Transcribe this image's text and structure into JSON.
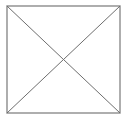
{
  "figure": {
    "background_color": "#ffffff",
    "canvas": {
      "width": 132,
      "height": 121
    },
    "square": {
      "left": 7,
      "top": 6,
      "right": 120,
      "bottom": 113,
      "width": 113,
      "height": 107,
      "stroke_color": "#8c8c8c",
      "stroke_width": 1.4,
      "fill": "none"
    },
    "diagonals": {
      "stroke_color": "#6e6e6e",
      "stroke_width": 1,
      "lines": [
        {
          "name": "diagonal-top-left-to-bottom-right",
          "x1": 7,
          "y1": 6,
          "x2": 120,
          "y2": 113
        },
        {
          "name": "diagonal-top-right-to-bottom-left",
          "x1": 120,
          "y1": 6,
          "x2": 7,
          "y2": 113
        }
      ]
    },
    "vertices": [
      {
        "name": "top-left",
        "x": 7,
        "y": 6
      },
      {
        "name": "top-right",
        "x": 120,
        "y": 6
      },
      {
        "name": "bottom-right",
        "x": 120,
        "y": 113
      },
      {
        "name": "bottom-left",
        "x": 7,
        "y": 113
      }
    ],
    "center": {
      "name": "diagonal-intersection",
      "x": 63.5,
      "y": 59.5
    }
  }
}
